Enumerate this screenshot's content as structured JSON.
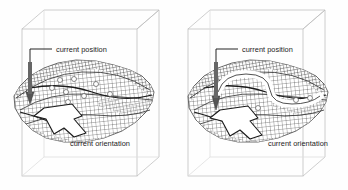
{
  "figure": {
    "title": "",
    "background_color": "#fefefe",
    "ink_color": "#1b1b1b",
    "box_color": "#b9b9b9",
    "mesh_color": "#3c3c3c",
    "marker_color": "#ffffff",
    "panel_count": 2
  },
  "panels": [
    {
      "id": "left-panel",
      "position_label": "current position",
      "orientation_label": "current orientation",
      "path_style": "straight",
      "marker_count": 9,
      "arrow_direction": "down-left"
    },
    {
      "id": "right-panel",
      "position_label": "current position",
      "orientation_label": "current orientation",
      "path_style": "curved",
      "marker_count": 6,
      "arrow_direction": "down-left"
    }
  ]
}
